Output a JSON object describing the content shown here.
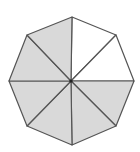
{
  "diagram": {
    "shape": "regular octagon",
    "sectors_total": 8,
    "sectors_shaded": 6,
    "sectors_unshaded": 2,
    "colors": {
      "shaded": "#d9d9d9",
      "unshaded": "#ffffff",
      "stroke": "#555555",
      "center_dot": "#222222"
    },
    "center": [
      71,
      81
    ],
    "vertices": [
      [
        72,
        17
      ],
      [
        116,
        35
      ],
      [
        134,
        81
      ],
      [
        116,
        126
      ],
      [
        72,
        145
      ],
      [
        27,
        126
      ],
      [
        9,
        81
      ],
      [
        27,
        35
      ]
    ],
    "sector_fills": [
      "#ffffff",
      "#ffffff",
      "#d9d9d9",
      "#d9d9d9",
      "#d9d9d9",
      "#d9d9d9",
      "#d9d9d9",
      "#d9d9d9"
    ]
  }
}
